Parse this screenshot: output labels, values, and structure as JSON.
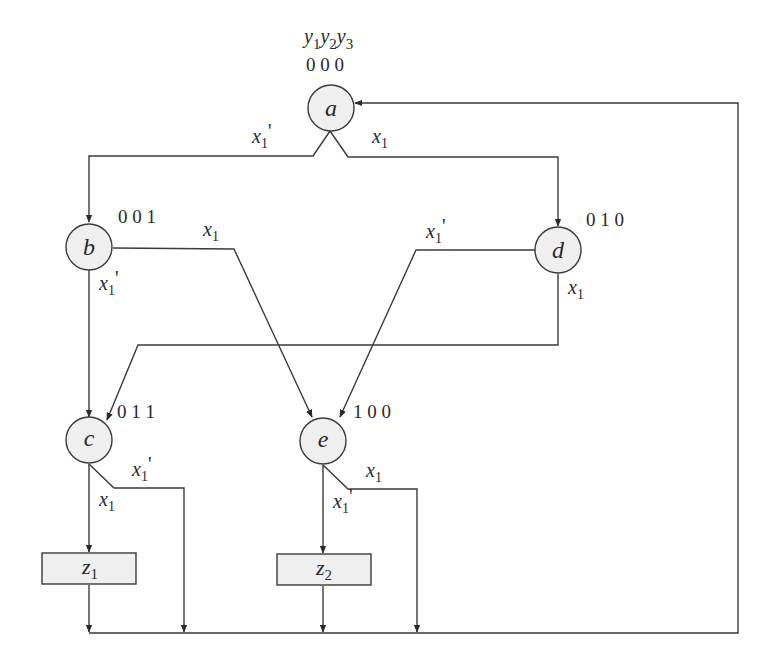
{
  "header": {
    "state_vars_label": [
      "y",
      "1",
      "y",
      "2",
      "y",
      "3"
    ]
  },
  "states": {
    "a": {
      "label": "a",
      "code": "0 0 0"
    },
    "b": {
      "label": "b",
      "code": "0 0 1"
    },
    "c": {
      "label": "c",
      "code": "0 1 1"
    },
    "d": {
      "label": "d",
      "code": "0 1 0"
    },
    "e": {
      "label": "e",
      "code": "1 0 0"
    }
  },
  "outputs": {
    "z1": {
      "base": "z",
      "sub": "1"
    },
    "z2": {
      "base": "z",
      "sub": "2"
    }
  },
  "transitions": [
    {
      "from": "a",
      "to": "b",
      "cond_base": "x",
      "cond_sub": "1",
      "cond_prime": "'"
    },
    {
      "from": "a",
      "to": "d",
      "cond_base": "x",
      "cond_sub": "1",
      "cond_prime": ""
    },
    {
      "from": "b",
      "to": "e",
      "cond_base": "x",
      "cond_sub": "1",
      "cond_prime": ""
    },
    {
      "from": "b",
      "to": "c",
      "cond_base": "x",
      "cond_sub": "1",
      "cond_prime": "'"
    },
    {
      "from": "d",
      "to": "e",
      "cond_base": "x",
      "cond_sub": "1",
      "cond_prime": "'"
    },
    {
      "from": "d",
      "to": "c",
      "cond_base": "x",
      "cond_sub": "1",
      "cond_prime": ""
    },
    {
      "from": "c",
      "to": "z1",
      "cond_base": "x",
      "cond_sub": "1",
      "cond_prime": ""
    },
    {
      "from": "c",
      "to": "a",
      "cond_base": "x",
      "cond_sub": "1",
      "cond_prime": "'"
    },
    {
      "from": "e",
      "to": "z2",
      "cond_base": "x",
      "cond_sub": "1",
      "cond_prime": "'"
    },
    {
      "from": "e",
      "to": "a",
      "cond_base": "x",
      "cond_sub": "1",
      "cond_prime": ""
    }
  ],
  "colors": {
    "line": "#3a3a3a",
    "node_fill": "#efefef",
    "text": "#2a2a2a"
  }
}
